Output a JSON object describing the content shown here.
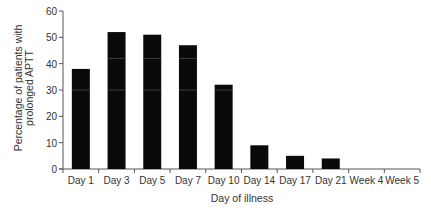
{
  "chart_data": {
    "type": "bar",
    "title": "",
    "xlabel": "Day of illness",
    "ylabel_lines": [
      "Percentage of patients with",
      "prolonged APTT"
    ],
    "ylabel": "Percentage of patients with prolonged APTT",
    "categories": [
      "Day 1",
      "Day 3",
      "Day 5",
      "Day 7",
      "Day 10",
      "Day 14",
      "Day 17",
      "Day 21",
      "Week 4",
      "Week 5"
    ],
    "values": [
      38,
      52,
      51,
      47,
      32,
      9,
      5,
      4,
      0,
      0
    ],
    "ylim": [
      0,
      60
    ],
    "yticks": [
      0,
      10,
      20,
      30,
      40,
      50,
      60
    ],
    "grid": false,
    "legend": null,
    "bar_color": "#0a0a0a"
  }
}
